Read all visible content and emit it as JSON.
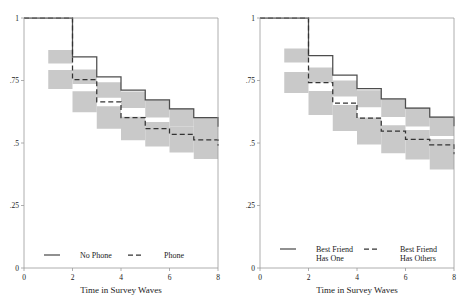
{
  "figure": {
    "title": "",
    "panel_count": 2,
    "band_color": "#c9c9c9",
    "solid_color": "#4d4d4d",
    "dashed_color": "#333333",
    "axis_color": "#9a9a9a"
  },
  "panels": [
    {
      "id": "left",
      "xlabel": "Time in Survey Waves",
      "ylabel": "",
      "xticks": [
        "0",
        "2",
        "4",
        "6",
        "8"
      ],
      "xtick_values": [
        0,
        2,
        4,
        6,
        8
      ],
      "yticks": [
        "0",
        ".25",
        ".5",
        ".75",
        "1"
      ],
      "ytick_values": [
        0,
        0.25,
        0.5,
        0.75,
        1
      ],
      "legend": [
        {
          "label": "No Phone",
          "style": "solid",
          "name": "legend-no-phone"
        },
        {
          "label": "Phone",
          "style": "dashed",
          "name": "legend-phone"
        }
      ]
    },
    {
      "id": "right",
      "xlabel": "Time in Survey Waves",
      "ylabel": "",
      "xticks": [
        "0",
        "2",
        "4",
        "6",
        "8"
      ],
      "xtick_values": [
        0,
        2,
        4,
        6,
        8
      ],
      "yticks": [
        "0",
        ".25",
        ".5",
        ".75",
        "1"
      ],
      "ytick_values": [
        0,
        0.25,
        0.5,
        0.75,
        1
      ],
      "legend": [
        {
          "label": "Best Friend\nHas One",
          "style": "solid",
          "name": "legend-best-friend-has-one"
        },
        {
          "label": "Best Friend\nHas Others",
          "style": "dashed",
          "name": "legend-best-friend-has-others"
        }
      ]
    }
  ],
  "chart_data": [
    {
      "type": "line",
      "subtype": "kaplan-meier-step-with-ci-band",
      "title": "",
      "xlabel": "Time in Survey Waves",
      "ylabel": "",
      "xlim": [
        0,
        8
      ],
      "ylim": [
        0,
        1
      ],
      "grid": false,
      "legend_position": "bottom",
      "x": [
        0,
        1,
        2,
        3,
        4,
        5,
        6,
        7,
        8
      ],
      "series": [
        {
          "name": "No Phone",
          "style": "solid",
          "values": [
            1.0,
            1.0,
            0.845,
            0.765,
            0.712,
            0.673,
            0.637,
            0.602,
            0.565
          ],
          "ci_lower": [
            1.0,
            1.0,
            0.818,
            0.736,
            0.681,
            0.64,
            0.602,
            0.565,
            0.527
          ],
          "ci_upper": [
            1.0,
            1.0,
            0.872,
            0.794,
            0.743,
            0.706,
            0.672,
            0.639,
            0.603
          ]
        },
        {
          "name": "Phone",
          "style": "dashed",
          "values": [
            1.0,
            1.0,
            0.754,
            0.665,
            0.602,
            0.558,
            0.535,
            0.513,
            0.489
          ],
          "ci_lower": [
            1.0,
            1.0,
            0.716,
            0.623,
            0.557,
            0.511,
            0.486,
            0.462,
            0.436
          ],
          "ci_upper": [
            1.0,
            1.0,
            0.792,
            0.707,
            0.647,
            0.605,
            0.584,
            0.564,
            0.542
          ]
        }
      ]
    },
    {
      "type": "line",
      "subtype": "kaplan-meier-step-with-ci-band",
      "title": "",
      "xlabel": "Time in Survey Waves",
      "ylabel": "",
      "xlim": [
        0,
        8
      ],
      "ylim": [
        0,
        1
      ],
      "grid": false,
      "legend_position": "bottom",
      "x": [
        0,
        1,
        2,
        3,
        4,
        5,
        6,
        7,
        8
      ],
      "series": [
        {
          "name": "Best Friend Has One",
          "style": "solid",
          "values": [
            1.0,
            1.0,
            0.85,
            0.772,
            0.718,
            0.677,
            0.64,
            0.604,
            0.567
          ],
          "ci_lower": [
            1.0,
            1.0,
            0.822,
            0.742,
            0.686,
            0.643,
            0.604,
            0.566,
            0.528
          ],
          "ci_upper": [
            1.0,
            1.0,
            0.878,
            0.802,
            0.75,
            0.711,
            0.676,
            0.642,
            0.606
          ]
        },
        {
          "name": "Best Friend Has Others",
          "style": "dashed",
          "values": [
            1.0,
            1.0,
            0.742,
            0.66,
            0.6,
            0.548,
            0.515,
            0.493,
            0.455
          ],
          "ci_lower": [
            1.0,
            1.0,
            0.7,
            0.612,
            0.548,
            0.494,
            0.459,
            0.434,
            0.394
          ],
          "ci_upper": [
            1.0,
            1.0,
            0.784,
            0.708,
            0.652,
            0.602,
            0.571,
            0.552,
            0.516
          ]
        }
      ]
    }
  ]
}
